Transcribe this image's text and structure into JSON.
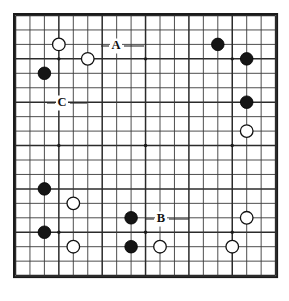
{
  "figure": {
    "kind": "go-board-diagram",
    "board_size": 19,
    "title": "",
    "background_color": "#ffffff",
    "line_color": "#3a3a3a",
    "border_color": "#1a1a1a",
    "black_stone_color": "#151515",
    "white_stone_color": "#ffffff"
  },
  "geometry": {
    "origin_x": 15.5,
    "origin_y": 15.5,
    "spacing": 14.45,
    "stone_radius": 6.3,
    "star_radius": 1.7
  },
  "star_points": [
    {
      "col": 3,
      "row": 3
    },
    {
      "col": 9,
      "row": 3
    },
    {
      "col": 15,
      "row": 3
    },
    {
      "col": 3,
      "row": 9
    },
    {
      "col": 9,
      "row": 9
    },
    {
      "col": 15,
      "row": 9
    },
    {
      "col": 3,
      "row": 15
    },
    {
      "col": 9,
      "row": 15
    },
    {
      "col": 15,
      "row": 15
    }
  ],
  "stones": [
    {
      "id": "w1",
      "color": "white",
      "col": 3,
      "row": 2
    },
    {
      "id": "w2",
      "color": "white",
      "col": 5,
      "row": 3
    },
    {
      "id": "b1",
      "color": "black",
      "col": 2,
      "row": 4
    },
    {
      "id": "b2",
      "color": "black",
      "col": 14,
      "row": 2
    },
    {
      "id": "b3",
      "color": "black",
      "col": 16,
      "row": 3
    },
    {
      "id": "b4",
      "color": "black",
      "col": 16,
      "row": 6
    },
    {
      "id": "w3",
      "color": "white",
      "col": 16,
      "row": 8
    },
    {
      "id": "b5",
      "color": "black",
      "col": 2,
      "row": 12
    },
    {
      "id": "w4",
      "color": "white",
      "col": 4,
      "row": 13
    },
    {
      "id": "b6",
      "color": "black",
      "col": 8,
      "row": 14
    },
    {
      "id": "w5",
      "color": "white",
      "col": 16,
      "row": 14
    },
    {
      "id": "b7",
      "color": "black",
      "col": 2,
      "row": 15
    },
    {
      "id": "w6",
      "color": "white",
      "col": 4,
      "row": 16
    },
    {
      "id": "b8",
      "color": "black",
      "col": 8,
      "row": 16
    },
    {
      "id": "w7",
      "color": "white",
      "col": 10,
      "row": 16
    },
    {
      "id": "w8",
      "color": "white",
      "col": 15,
      "row": 16
    }
  ],
  "labels": [
    {
      "id": "label-a",
      "text": "A",
      "x": 116,
      "y": 46,
      "leader": {
        "x1": 124,
        "y1": 46,
        "x2": 144,
        "y2": 46
      }
    },
    {
      "id": "label-b",
      "text": "B",
      "x": 161,
      "y": 219,
      "leader": {
        "x1": 169,
        "y1": 219,
        "x2": 189,
        "y2": 219
      }
    },
    {
      "id": "label-c",
      "text": "C",
      "x": 62,
      "y": 103,
      "leader": {
        "x1": 70,
        "y1": 103,
        "x2": 87,
        "y2": 103
      }
    }
  ],
  "label_leader_left": [
    {
      "id": "label-a-left",
      "x1": 101,
      "y1": 46,
      "x2": 109,
      "y2": 46
    },
    {
      "id": "label-b-left",
      "x1": 146,
      "y1": 219,
      "x2": 154,
      "y2": 219
    },
    {
      "id": "label-c-left",
      "x1": 47,
      "y1": 103,
      "x2": 55,
      "y2": 103
    }
  ]
}
